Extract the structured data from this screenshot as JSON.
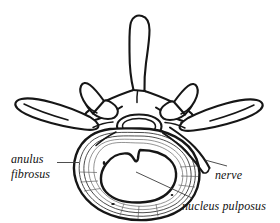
{
  "figure": {
    "background_color": "#ffffff",
    "ink_color": "#161616",
    "width": 280,
    "height": 223
  },
  "labels": {
    "anulus": {
      "line1": "anulus",
      "line2": "fibrosus",
      "full": "anulus fibrosus"
    },
    "nerve": {
      "text": "nerve"
    },
    "nucleus": {
      "text": "nucleus pulposus"
    }
  },
  "structures": {
    "spinous_process": "spinous-process",
    "transverse_process_left": "transverse-process-left",
    "transverse_process_right": "transverse-process-right",
    "superior_articular_left": "superior-articular-process-left",
    "superior_articular_right": "superior-articular-process-right",
    "vertebral_foramen": "vertebral-foramen",
    "anulus_fibrosus": "anulus-fibrosus-rings",
    "nucleus_pulposus": "nucleus-pulposus",
    "nerve_root": "nerve-root"
  }
}
